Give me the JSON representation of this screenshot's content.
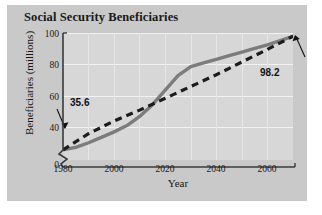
{
  "figure": {
    "title": "Social Security Beneficiaries",
    "panel_color": "#c9c9c9",
    "plot_color": "#d7d7d7",
    "gridline_color": "#f2f2f2"
  },
  "chart_data": {
    "type": "line",
    "title": "Social Security Beneficiaries",
    "xlabel": "Year",
    "ylabel": "Beneficiaries (millions)",
    "xlim": [
      1980,
      2070
    ],
    "ylim": [
      30,
      100
    ],
    "y_axis_break": true,
    "y_axis_break_symbol": "zigzag",
    "xticks": [
      1980,
      2000,
      2020,
      2040,
      2060
    ],
    "yticks": [
      0,
      40,
      60,
      80,
      100
    ],
    "grid": true,
    "legend": "none",
    "annotations": [
      {
        "text": "35.6",
        "x": 1980,
        "y": 35.6,
        "series": "actual-and-projected",
        "position": "upper-left-of-point"
      },
      {
        "text": "98.2",
        "x": 2070,
        "y": 98.2,
        "series": "actual-and-projected",
        "position": "lower-right-of-point"
      }
    ],
    "series": [
      {
        "name": "Beneficiaries (curve)",
        "style": "solid",
        "color": "#7c7c7c",
        "x": [
          1980,
          1985,
          1990,
          1995,
          2000,
          2005,
          2010,
          2015,
          2020,
          2025,
          2030,
          2035,
          2040,
          2045,
          2050,
          2055,
          2060,
          2065,
          2070
        ],
        "values": [
          35.6,
          37.0,
          39.5,
          42.5,
          45.5,
          49.0,
          54.0,
          60.5,
          68.5,
          76.5,
          81.5,
          83.5,
          85.5,
          87.5,
          89.5,
          91.5,
          93.5,
          95.8,
          98.2
        ]
      },
      {
        "name": "Trend (dashed)",
        "style": "dashed",
        "color": "#1c1c1c",
        "x": [
          1980,
          1990,
          2000,
          2010,
          2020,
          2030,
          2040,
          2050,
          2060,
          2070
        ],
        "values": [
          35.6,
          44.5,
          51.5,
          57.5,
          64.0,
          70.5,
          77.0,
          84.0,
          91.0,
          98.2
        ]
      }
    ]
  },
  "axes": {
    "y_tick_labels": [
      "100",
      "80",
      "60",
      "40",
      "0"
    ],
    "x_tick_labels": [
      "1980",
      "2000",
      "2020",
      "2040",
      "2060"
    ],
    "y_title": "Beneficiaries (millions)",
    "x_title": "Year"
  }
}
